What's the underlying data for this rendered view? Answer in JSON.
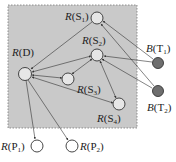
{
  "diagram": {
    "region": {
      "x": 8,
      "y": 5,
      "w": 129,
      "h": 123,
      "fill": "#c8c8c8",
      "border": "#888888"
    },
    "nodes": [
      {
        "id": "S1",
        "letter": "R",
        "sub": "1",
        "name": "S",
        "cx": 97,
        "cy": 18,
        "filled": false
      },
      {
        "id": "S2",
        "letter": "R",
        "sub": "2",
        "name": "S",
        "cx": 97,
        "cy": 55,
        "filled": false
      },
      {
        "id": "D",
        "letter": "R",
        "name": "D",
        "cx": 25,
        "cy": 74,
        "filled": false
      },
      {
        "id": "S3",
        "letter": "R",
        "sub": "3",
        "name": "S",
        "cx": 68,
        "cy": 79,
        "filled": false
      },
      {
        "id": "S4",
        "letter": "R",
        "sub": "4",
        "name": "S",
        "cx": 119,
        "cy": 104,
        "filled": false
      },
      {
        "id": "T1",
        "letter": "B",
        "sub": "1",
        "name": "T",
        "cx": 158,
        "cy": 63,
        "filled": true
      },
      {
        "id": "T2",
        "letter": "B",
        "sub": "2",
        "name": "T",
        "cx": 158,
        "cy": 91,
        "filled": true
      },
      {
        "id": "P1",
        "letter": "R",
        "sub": "1",
        "name": "P",
        "cx": 37,
        "cy": 146,
        "filled": false
      },
      {
        "id": "P2",
        "letter": "R",
        "sub": "2",
        "name": "P",
        "cx": 72,
        "cy": 146,
        "filled": false
      }
    ],
    "labels": {
      "S1": "R(S1)",
      "S2": "R(S2)",
      "D": "R(D)",
      "S3": "R(S3)",
      "S4": "R(S4)",
      "T1": "B(T1)",
      "T2": "B(T2)",
      "P1": "R(P1)",
      "P2": "R(P2)"
    },
    "edges": [
      {
        "from": "S1",
        "to": "D",
        "type": "directed"
      },
      {
        "from": "S2",
        "to": "D",
        "type": "bidirectional"
      },
      {
        "from": "S3",
        "to": "D",
        "type": "bidirectional"
      },
      {
        "from": "S4",
        "to": "D",
        "type": "bidirectional"
      },
      {
        "from": "S3",
        "to": "S2",
        "type": "bidirectional"
      },
      {
        "from": "S2",
        "to": "S4",
        "type": "bidirectional"
      },
      {
        "from": "T1",
        "to": "S1",
        "type": "directed"
      },
      {
        "from": "T1",
        "to": "S2",
        "type": "directed"
      },
      {
        "from": "T2",
        "to": "S1",
        "type": "directed"
      },
      {
        "from": "T2",
        "to": "S2",
        "type": "directed"
      },
      {
        "from": "D",
        "to": "P1",
        "type": "directed"
      },
      {
        "from": "D",
        "to": "P2",
        "type": "directed"
      }
    ]
  }
}
